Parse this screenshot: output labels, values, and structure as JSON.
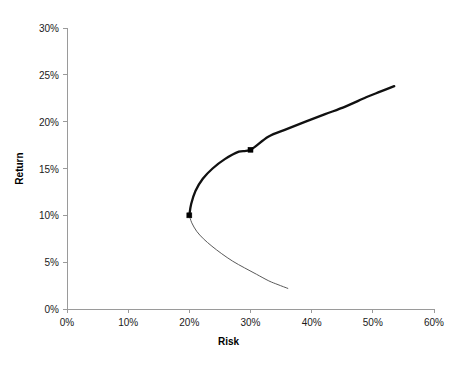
{
  "chart_data": {
    "type": "line",
    "title": "",
    "xlabel": "Risk",
    "ylabel": "Return",
    "xlim": [
      0,
      60
    ],
    "ylim": [
      0,
      30
    ],
    "grid": false,
    "legend": "none",
    "x_tick_labels": [
      "0%",
      "10%",
      "20%",
      "30%",
      "40%",
      "50%",
      "60%"
    ],
    "x_tick_values": [
      0,
      10,
      20,
      30,
      40,
      50,
      60
    ],
    "y_tick_labels": [
      "0%",
      "5%",
      "10%",
      "15%",
      "20%",
      "25%",
      "30%"
    ],
    "y_tick_values": [
      0,
      5,
      10,
      15,
      20,
      25,
      30
    ],
    "series": [
      {
        "name": "efficient-frontier",
        "style": "thick",
        "color": "#111111",
        "width": 2.3,
        "x": [
          20.0,
          20.3,
          21.0,
          22.2,
          23.8,
          25.8,
          28.1,
          30.0,
          32.9,
          35.9,
          39.0,
          42.2,
          45.5,
          48.9,
          51.2,
          53.5
        ],
        "y": [
          10.0,
          11.2,
          12.6,
          13.9,
          15.0,
          16.0,
          16.8,
          17.0,
          18.4,
          19.2,
          20.0,
          20.8,
          21.6,
          22.6,
          23.2,
          23.8
        ]
      },
      {
        "name": "inefficient-frontier",
        "style": "thin",
        "color": "#5a5a5a",
        "width": 1.0,
        "x": [
          20.0,
          20.4,
          21.2,
          22.3,
          23.7,
          25.3,
          27.1,
          29.0,
          31.0,
          33.0,
          34.5,
          36.1
        ],
        "y": [
          10.0,
          9.2,
          8.3,
          7.5,
          6.7,
          5.9,
          5.1,
          4.4,
          3.7,
          3.0,
          2.6,
          2.2
        ]
      }
    ],
    "markers": [
      {
        "name": "minimum-variance-portfolio",
        "x": 20.0,
        "y": 10.0,
        "color": "#000000",
        "size": 5
      },
      {
        "name": "portfolio-point",
        "x": 30.0,
        "y": 17.0,
        "color": "#000000",
        "size": 5
      }
    ],
    "axis_color": "#9a9a9a",
    "tick_color": "#9a9a9a",
    "text_color": "#1a1a1a"
  },
  "axes": {
    "x_title": "Risk",
    "y_title": "Return"
  }
}
